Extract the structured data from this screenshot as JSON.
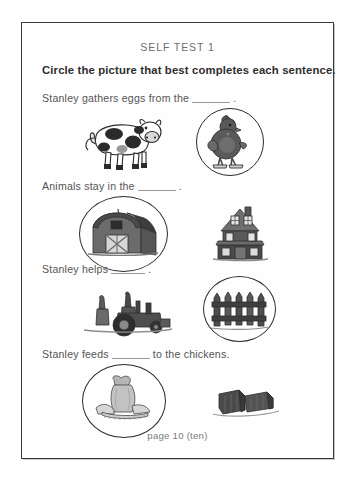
{
  "page": {
    "header_title": "SELF TEST 1",
    "instruction": "Circle the picture that best completes each sentence.",
    "footer": "page 10 (ten)",
    "border_color": "#3a3a3a"
  },
  "questions": [
    {
      "id": "q1",
      "text_before": "Stanley gathers eggs from the",
      "text_after": ".",
      "blank": "______",
      "options": [
        {
          "name": "cow",
          "label": "cow-illustration",
          "circled": false
        },
        {
          "name": "hen",
          "label": "hen-illustration",
          "circled": true
        }
      ]
    },
    {
      "id": "q2",
      "text_before": "Animals stay in the",
      "text_after": ".",
      "blank": "______",
      "options": [
        {
          "name": "barn",
          "label": "barn-illustration",
          "circled": true
        },
        {
          "name": "house",
          "label": "house-illustration",
          "circled": false
        }
      ]
    },
    {
      "id": "q3",
      "text_before": "Stanley helps",
      "text_after": ".",
      "blank": "______",
      "options": [
        {
          "name": "tractor",
          "label": "tractor-illustration",
          "circled": false
        },
        {
          "name": "fence",
          "label": "fence-illustration",
          "circled": true
        }
      ]
    },
    {
      "id": "q4",
      "text_before": "Stanley feeds",
      "text_after": "to the chickens.",
      "blank": "______",
      "options": [
        {
          "name": "feed-sack",
          "label": "feed-sack-illustration",
          "circled": true
        },
        {
          "name": "hay-bales",
          "label": "hay-bales-illustration",
          "circled": false
        }
      ]
    }
  ]
}
